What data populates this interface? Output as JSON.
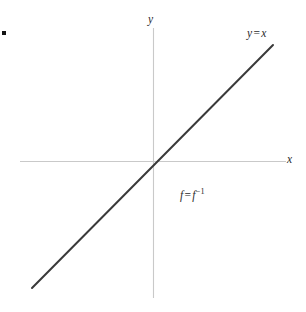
{
  "figure": {
    "background_color": "#ffffff",
    "width": 306,
    "height": 312,
    "bullet_marker": {
      "name": "bullet-square",
      "color": "#141414"
    }
  },
  "chart_data": {
    "type": "line",
    "title": "",
    "xlabel": "x",
    "ylabel": "y",
    "grid": false,
    "legend": "none",
    "axes": {
      "x_axis": {
        "label": "x",
        "color": "#c9c9c9",
        "orientation": "horizontal",
        "pixel_y": 161,
        "pixel_x_start": 20,
        "pixel_x_end": 286
      },
      "y_axis": {
        "label": "y",
        "color": "#c9c9c9",
        "orientation": "vertical",
        "pixel_x": 153,
        "pixel_y_start": 28,
        "pixel_y_end": 298
      },
      "origin": {
        "pixel_x": 153,
        "pixel_y": 161
      }
    },
    "series": [
      {
        "name": "y = x",
        "equation": "y = x",
        "slope": 1,
        "intercept": 0,
        "color": "#3a3a3a",
        "line_width": 2,
        "x": [
          -1,
          1
        ],
        "y": [
          -1,
          1
        ],
        "pixel_endpoints": [
          {
            "x": 32,
            "y": 288
          },
          {
            "x": 273,
            "y": 45
          }
        ]
      }
    ],
    "annotations": [
      {
        "name": "line-equation",
        "text": "y = x",
        "lhs": "y",
        "operator": "=",
        "rhs": "x",
        "pixel_x": 247,
        "pixel_y": 28
      },
      {
        "name": "inverse-function",
        "text": "f = f⁻¹",
        "lhs": "f",
        "operator": "=",
        "rhs_base": "f",
        "rhs_exponent": "−1",
        "pixel_x": 180,
        "pixel_y": 188
      }
    ]
  },
  "labels": {
    "y_axis": "y",
    "x_axis": "x",
    "line_equation_lhs": "y",
    "line_equation_operator": "=",
    "line_equation_rhs": "x",
    "inverse_lhs": "f",
    "inverse_operator": "=",
    "inverse_rhs_base": "f",
    "inverse_rhs_exponent": "−1"
  }
}
